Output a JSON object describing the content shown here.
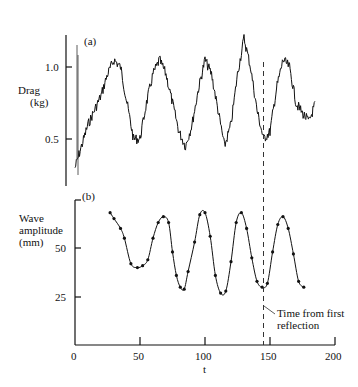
{
  "chart_data": [
    {
      "panel": "(a)",
      "type": "line",
      "title": "",
      "xlabel": "",
      "ylabel": "Drag (kg)",
      "yticks": [
        0.5,
        1.0
      ],
      "ylim": [
        0.25,
        1.3
      ],
      "xlim": [
        0,
        200
      ],
      "grid": false,
      "series": [
        {
          "name": "Drag",
          "x": [
            0,
            5,
            10,
            20,
            25,
            30,
            35,
            40,
            45,
            50,
            55,
            60,
            65,
            70,
            75,
            80,
            85,
            90,
            95,
            100,
            105,
            110,
            115,
            120,
            125,
            130,
            135,
            140,
            145,
            150,
            155,
            160,
            165,
            170,
            175,
            180,
            185
          ],
          "values": [
            0.3,
            0.45,
            0.6,
            0.8,
            0.95,
            1.05,
            1.0,
            0.75,
            0.5,
            0.5,
            0.75,
            0.95,
            1.05,
            0.95,
            0.75,
            0.55,
            0.45,
            0.6,
            0.85,
            1.05,
            0.95,
            0.7,
            0.45,
            0.6,
            0.95,
            1.2,
            1.0,
            0.7,
            0.5,
            0.55,
            0.85,
            1.05,
            1.0,
            0.75,
            0.68,
            0.62,
            0.75
          ]
        }
      ],
      "annotations": [
        {
          "type": "vline",
          "x": 145,
          "style": "dashed"
        }
      ]
    },
    {
      "panel": "(b)",
      "type": "line",
      "title": "",
      "xlabel": "t",
      "ylabel": "Wave amplitude (mm)",
      "xticks": [
        0,
        50,
        100,
        150,
        200
      ],
      "yticks": [
        25,
        50
      ],
      "ylim": [
        0,
        75
      ],
      "xlim": [
        0,
        200
      ],
      "grid": false,
      "series": [
        {
          "name": "Wave amplitude",
          "x": [
            27,
            30,
            35,
            38,
            43,
            48,
            52,
            56,
            60,
            64,
            68,
            72,
            75,
            78,
            81,
            84,
            87,
            92,
            96,
            100,
            104,
            108,
            112,
            116,
            120,
            124,
            128,
            132,
            136,
            140,
            144,
            148,
            152,
            156,
            160,
            164,
            168,
            172,
            176
          ],
          "values": [
            68,
            65,
            60,
            55,
            42,
            40,
            41,
            44,
            55,
            63,
            66,
            63,
            48,
            36,
            30,
            29,
            38,
            53,
            67,
            68,
            56,
            36,
            27,
            28,
            43,
            63,
            68,
            60,
            45,
            33,
            30,
            32,
            48,
            62,
            66,
            60,
            47,
            33,
            30
          ]
        }
      ],
      "annotations": [
        {
          "type": "vline",
          "x": 145,
          "style": "dashed"
        },
        {
          "type": "text",
          "x": 150,
          "y": 12,
          "text": "Time from first reflection"
        }
      ]
    }
  ],
  "labels": {
    "panel_a": "(a)",
    "panel_b": "(b)",
    "drag_label_1": "Drag",
    "drag_label_2": "(kg)",
    "tick_a_1": "1.0",
    "tick_a_05": "0.5",
    "wave_label_1": "Wave",
    "wave_label_2": "amplitude",
    "wave_label_3": "(mm)",
    "tick_b_50": "50",
    "tick_b_25": "25",
    "x_ticks": [
      "0",
      "50",
      "100",
      "150",
      "200"
    ],
    "x_axis": "t",
    "annotation_1": "Time from first",
    "annotation_2": "reflection"
  }
}
